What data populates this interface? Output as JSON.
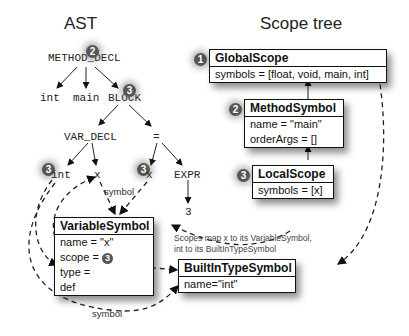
{
  "titles": {
    "ast": "AST",
    "scope_tree": "Scope tree"
  },
  "ast": {
    "method_decl": "METHOD_DECL",
    "int": "int",
    "main": "main",
    "block": "BLOCK",
    "var_decl": "VAR_DECL",
    "assign": "=",
    "int2": "int",
    "x1": "x",
    "x2": "x",
    "expr": "EXPR",
    "three": "3"
  },
  "badges": {
    "b1": "1",
    "b2": "2",
    "b3": "3"
  },
  "global_scope": {
    "title": "GlobalScope",
    "symbols": "symbols = [float, void, main, int]"
  },
  "method_symbol": {
    "title": "MethodSymbol",
    "name": "name = \"main\"",
    "order_args": "orderArgs = []"
  },
  "local_scope": {
    "title": "LocalScope",
    "symbols": "symbols = [x]"
  },
  "variable_symbol": {
    "title": "VariableSymbol",
    "name": "name = \"x\"",
    "scope": "scope = ",
    "type": "type = ",
    "def": "def"
  },
  "builtin_type_symbol": {
    "title": "BuiltInTypeSymbol",
    "name": "name=\"int\""
  },
  "note": {
    "line1": "Scopes map x to its VariableSymbol,",
    "line2": "int to its BuiltInTypeSymbol"
  },
  "labels": {
    "symbol_top": "symbol",
    "symbol_bottom": "symbol"
  }
}
